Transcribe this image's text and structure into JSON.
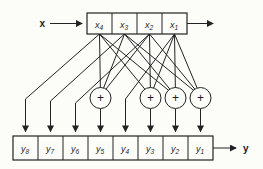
{
  "figure": {
    "background_color": "#fcfcf9",
    "line_color": "#222222",
    "input_label": "x",
    "output_label": "y",
    "adder_symbol": "+",
    "top_register": {
      "cells": [
        {
          "base": "x",
          "sub": "4"
        },
        {
          "base": "x",
          "sub": "3"
        },
        {
          "base": "x",
          "sub": "2"
        },
        {
          "base": "x",
          "sub": "1"
        }
      ]
    },
    "bottom_register": {
      "cells": [
        {
          "base": "y",
          "sub": "8"
        },
        {
          "base": "y",
          "sub": "7"
        },
        {
          "base": "y",
          "sub": "6"
        },
        {
          "base": "y",
          "sub": "5"
        },
        {
          "base": "y",
          "sub": "4"
        },
        {
          "base": "y",
          "sub": "3"
        },
        {
          "base": "y",
          "sub": "2"
        },
        {
          "base": "y",
          "sub": "1"
        }
      ]
    },
    "connections": {
      "direct": [
        {
          "from": "x4",
          "to": "y8"
        },
        {
          "from": "x3",
          "to": "y7"
        },
        {
          "from": "x2",
          "to": "y6"
        },
        {
          "from": "x1",
          "to": "y4"
        }
      ],
      "adders": [
        {
          "output": "y5",
          "inputs": [
            "x4",
            "x3",
            "x2"
          ]
        },
        {
          "output": "y3",
          "inputs": [
            "x4",
            "x2",
            "x1"
          ]
        },
        {
          "output": "y2",
          "inputs": [
            "x4",
            "x3",
            "x1"
          ]
        },
        {
          "output": "y1",
          "inputs": [
            "x3",
            "x2",
            "x1"
          ]
        }
      ]
    }
  }
}
